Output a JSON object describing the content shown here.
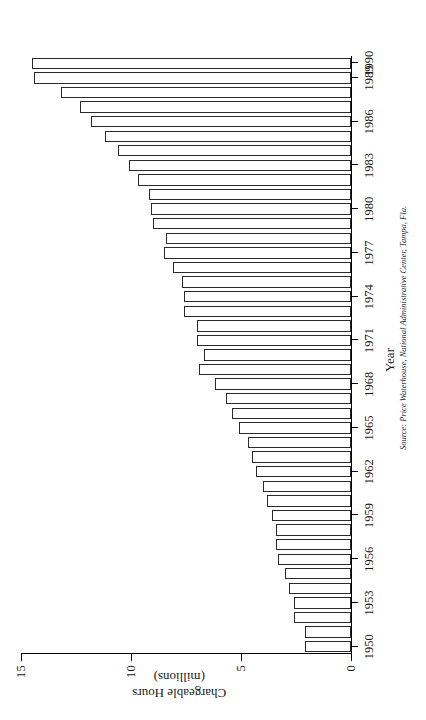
{
  "figure": {
    "orientation": "rotated-90-ccw",
    "source_note": "Source: Price Waterhouse, National Administrative Center, Tampa, Fla.",
    "ink_color": "#2a2a2a",
    "bar_fill": "#ffffff"
  },
  "chart_data": {
    "type": "bar",
    "title": "",
    "xlabel": "Year",
    "ylabel": "Chargeable Hours (millions)",
    "ylabel_line1": "Chargeable Hours",
    "ylabel_line2": "(millions)",
    "ylim": [
      0,
      15
    ],
    "yticks": [
      0,
      5,
      10,
      15
    ],
    "ytick_labels": [
      "0",
      "5",
      "10",
      "15"
    ],
    "xtick_labels": [
      "1950",
      "1953",
      "1956",
      "1959",
      "1962",
      "1965",
      "1968",
      "1971",
      "1974",
      "1977",
      "1980",
      "1983",
      "1986",
      "1989",
      "1990"
    ],
    "grid": false,
    "legend": null,
    "categories": [
      "1950",
      "1951",
      "1952",
      "1953",
      "1954",
      "1955",
      "1956",
      "1957",
      "1958",
      "1959",
      "1960",
      "1961",
      "1962",
      "1963",
      "1964",
      "1965",
      "1966",
      "1967",
      "1968",
      "1969",
      "1970",
      "1971",
      "1972",
      "1973",
      "1974",
      "1975",
      "1976",
      "1977",
      "1978",
      "1979",
      "1980",
      "1981",
      "1982",
      "1983",
      "1984",
      "1985",
      "1986",
      "1987",
      "1988",
      "1989",
      "1990"
    ],
    "values": [
      2.1,
      2.1,
      2.6,
      2.6,
      2.8,
      3.0,
      3.3,
      3.4,
      3.4,
      3.6,
      3.8,
      4.0,
      4.3,
      4.5,
      4.7,
      5.1,
      5.4,
      5.7,
      6.2,
      6.9,
      6.7,
      7.0,
      7.0,
      7.6,
      7.6,
      7.7,
      8.1,
      8.5,
      8.4,
      9.0,
      9.1,
      9.2,
      9.7,
      10.1,
      10.6,
      11.2,
      11.8,
      12.3,
      13.2,
      14.4,
      14.5
    ]
  }
}
